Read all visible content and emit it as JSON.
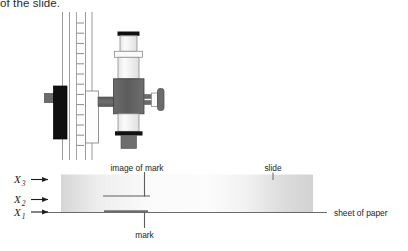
{
  "figure": {
    "caption_fragment": "of the slide.",
    "labels": {
      "image_of_mark": "image of mark",
      "slide": "slide",
      "mark": "mark",
      "sheet_of_paper": "sheet of paper"
    },
    "measurements": [
      {
        "symbol": "X",
        "subscript": "3",
        "full": "X3"
      },
      {
        "symbol": "X",
        "subscript": "2",
        "full": "X2"
      },
      {
        "symbol": "X",
        "subscript": "1",
        "full": "X1"
      }
    ],
    "colors": {
      "background": "#ffffff",
      "stroke": "#808080",
      "dark_stroke": "#4d4d4d",
      "black_part": "#111111",
      "dark_gray_body": "#5e5e5e",
      "mid_gray": "#707070",
      "light_tube": "#f2f2f2",
      "slide_light": "#fbfbfb",
      "slide_shade": "#d9d9d9",
      "text": "#1d1d1d"
    },
    "parts": {
      "eyepiece_cap": "eyepiece-cap",
      "eyepiece_tube": "eyepiece-tube",
      "draw_tube": "draw-tube",
      "body_block": "microscope-body-block",
      "focus_knob": "focus-knob",
      "objective_band": "objective-band",
      "objective_lens": "objective-lens",
      "vertical_pillar": "vertical-pillar",
      "scale_ticks": "scale-tick-marks",
      "black_counterweight": "black-counterweight-block",
      "white_slider": "white-slider-block",
      "slide_block": "glass-slide",
      "paper_line": "sheet-of-paper-line",
      "mark_line": "mark-line",
      "image_line": "image-of-mark-line"
    },
    "scale": {
      "tick_count": 13,
      "tick_top_y": 23,
      "tick_spacing": 10.2
    }
  }
}
